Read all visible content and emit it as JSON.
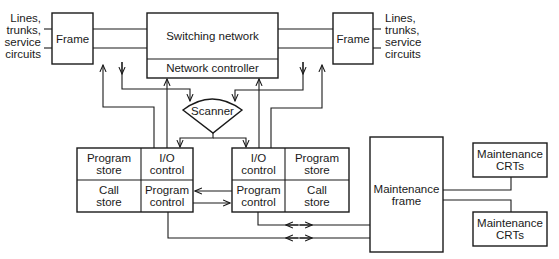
{
  "diagram": {
    "type": "block-diagram",
    "colors": {
      "line": "#1a1a1a",
      "background": "#ffffff"
    },
    "left_external": {
      "line1": "Lines,",
      "line2": "trunks,",
      "line3": "service",
      "line4": "circuits"
    },
    "right_external": {
      "line1": "Lines,",
      "line2": "trunks,",
      "line3": "service",
      "line4": "circuits"
    },
    "left_frame": {
      "label": "Frame"
    },
    "right_frame": {
      "label": "Frame"
    },
    "switching_network": {
      "label": "Switching network",
      "controller_label": "Network controller"
    },
    "scanner": {
      "label": "Scanner"
    },
    "left_processor": {
      "top_left": {
        "line1": "Program",
        "line2": "store"
      },
      "top_right": {
        "line1": "I/O",
        "line2": "control"
      },
      "bottom_left": {
        "line1": "Call",
        "line2": "store"
      },
      "bottom_right": {
        "line1": "Program",
        "line2": "control"
      }
    },
    "right_processor": {
      "top_left": {
        "line1": "I/O",
        "line2": "control"
      },
      "top_right": {
        "line1": "Program",
        "line2": "store"
      },
      "bottom_left": {
        "line1": "Program",
        "line2": "control"
      },
      "bottom_right": {
        "line1": "Call",
        "line2": "store"
      }
    },
    "maintenance_frame": {
      "line1": "Maintenance",
      "line2": "frame"
    },
    "maintenance_crts_top": {
      "line1": "Maintenance",
      "line2": "CRTs"
    },
    "maintenance_crts_bottom": {
      "line1": "Maintenance",
      "line2": "CRTs"
    }
  }
}
